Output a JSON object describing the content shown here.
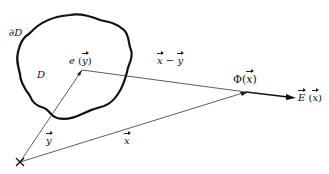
{
  "diagram": {
    "labels": {
      "boundary": "∂D",
      "domain": "D",
      "unit_vector": "e",
      "unit_vector_arg": "y",
      "difference_left": "x",
      "difference_op": " − ",
      "difference_right": "y",
      "potential": "Φ",
      "potential_arg": "x",
      "field": "E",
      "field_arg": "x",
      "vec_y": "y",
      "vec_x": "x",
      "origin_marker": "×"
    }
  }
}
